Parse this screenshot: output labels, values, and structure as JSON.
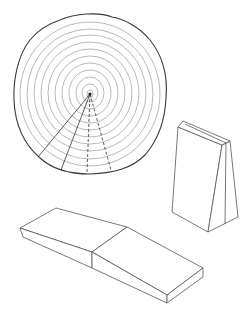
{
  "figure": {
    "colors": {
      "background": "#ffffff",
      "outline": "#3a3a3a",
      "rings": "#9a9a9a",
      "edges": "#555555"
    },
    "log_section": {
      "center": [
        90,
        94
      ],
      "ring_count": 11,
      "rays": [
        {
          "end": [
            38,
            157
          ],
          "style": "solid"
        },
        {
          "end": [
            61,
            170
          ],
          "style": "solid"
        },
        {
          "end": [
            87,
            173
          ],
          "style": "dashed"
        },
        {
          "end": [
            111,
            170
          ],
          "style": "dashed"
        }
      ]
    },
    "wedge_block": {
      "label": "tapered block"
    },
    "slab": {
      "label": "sloped slab"
    }
  }
}
